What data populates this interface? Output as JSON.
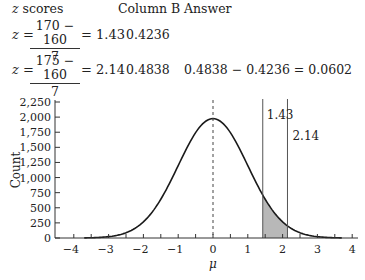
{
  "table": {
    "headers": {
      "z_italic": "z",
      "z_rest": " scores",
      "column_b": "Column B",
      "answer": "Answer"
    },
    "rows": [
      {
        "z_prefix": "z =",
        "numerator": "170 − 160",
        "denominator": "7",
        "result": "= 1.43",
        "column_b": "0.4236",
        "answer": ""
      },
      {
        "z_prefix": "z =",
        "numerator": "175 − 160",
        "denominator": "7",
        "result": "= 2.14",
        "column_b": "0.4838",
        "answer": "0.4838 − 0.4236 = 0.0602"
      }
    ]
  },
  "chart_data": {
    "type": "line",
    "title": "",
    "xlabel": "μ",
    "ylabel": "Count",
    "xlim": [
      -4,
      4
    ],
    "ylim": [
      0,
      2250
    ],
    "x_ticks": [
      "−4",
      "−3",
      "−2",
      "−1",
      "0",
      "1",
      "2",
      "3",
      "4"
    ],
    "y_ticks": [
      "0",
      "250",
      "500",
      "750",
      "1,000",
      "1,250",
      "1,500",
      "1,750",
      "2,000",
      "2,250"
    ],
    "series": [
      {
        "name": "normal curve",
        "peak_x": 0,
        "peak_y": 1975,
        "sd": 1
      }
    ],
    "annotations": {
      "mean_line": {
        "x": 0,
        "style": "dashed"
      },
      "vertical_lines": [
        {
          "x": 1.43,
          "label": "1.43"
        },
        {
          "x": 2.14,
          "label": "2.14"
        }
      ],
      "shaded_region": {
        "from": 1.43,
        "to": 2.14,
        "color": "#b8b8b8"
      }
    },
    "grid": false,
    "legend": "none"
  }
}
